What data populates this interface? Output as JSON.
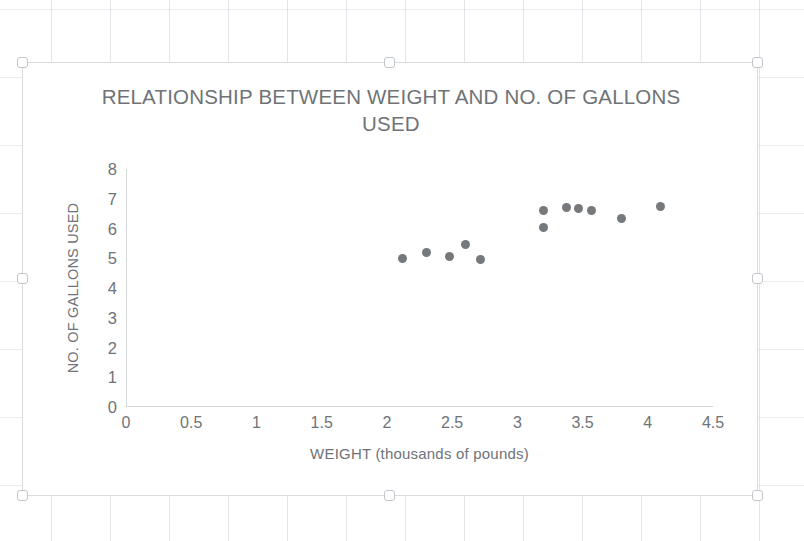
{
  "chart_data": {
    "type": "scatter",
    "title": "RELATIONSHIP BETWEEN WEIGHT AND NO. OF GALLONS USED",
    "xlabel": "WEIGHT (thousands of pounds)",
    "ylabel": "NO. OF GALLONS USED",
    "xlim": [
      0,
      4.5
    ],
    "ylim": [
      0,
      8
    ],
    "xticks": [
      "0",
      "0.5",
      "1",
      "1.5",
      "2",
      "2.5",
      "3",
      "3.5",
      "4",
      "4.5"
    ],
    "xtick_values": [
      0,
      0.5,
      1,
      1.5,
      2,
      2.5,
      3,
      3.5,
      4,
      4.5
    ],
    "yticks": [
      "0",
      "1",
      "2",
      "3",
      "4",
      "5",
      "6",
      "7",
      "8"
    ],
    "ytick_values": [
      0,
      1,
      2,
      3,
      4,
      5,
      6,
      7,
      8
    ],
    "grid": false,
    "legend": "none",
    "marker_color": "#76797c",
    "points": [
      {
        "x": 2.12,
        "y": 5.0
      },
      {
        "x": 2.3,
        "y": 5.2
      },
      {
        "x": 2.48,
        "y": 5.05
      },
      {
        "x": 2.6,
        "y": 5.45
      },
      {
        "x": 2.72,
        "y": 4.95
      },
      {
        "x": 3.2,
        "y": 6.6
      },
      {
        "x": 3.2,
        "y": 6.05
      },
      {
        "x": 3.38,
        "y": 6.7
      },
      {
        "x": 3.47,
        "y": 6.68
      },
      {
        "x": 3.57,
        "y": 6.6
      },
      {
        "x": 3.8,
        "y": 6.35
      },
      {
        "x": 4.1,
        "y": 6.75
      }
    ]
  },
  "chart_object": {
    "selected": true,
    "handles": [
      "top-left",
      "top-middle",
      "top-right",
      "middle-left",
      "middle-right",
      "bottom-left",
      "bottom-middle",
      "bottom-right"
    ]
  }
}
